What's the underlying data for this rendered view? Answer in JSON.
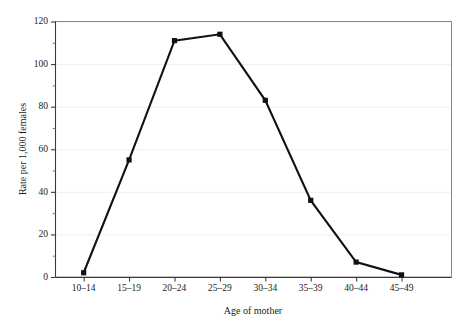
{
  "chart_data": {
    "type": "line",
    "title": "",
    "subtitle": "",
    "xlabel": "Age of mother",
    "ylabel": "Rate per 1,000 females",
    "categories": [
      "10–14",
      "15–19",
      "20–24",
      "25–29",
      "30–34",
      "35–39",
      "40–44",
      "45–49"
    ],
    "values": [
      2,
      55,
      111,
      114,
      83,
      36,
      7,
      1
    ],
    "ylim": [
      0,
      120
    ],
    "ytick_labels": [
      "0",
      "20",
      "40",
      "60",
      "80",
      "100",
      "120"
    ],
    "ytick_values": [
      0,
      20,
      40,
      60,
      80,
      100,
      120
    ],
    "yminor_values": [
      10,
      30,
      50,
      70,
      90,
      110
    ],
    "grid": "horizontal-faint",
    "legend": "none",
    "series": [
      {
        "name": "Birth rate",
        "values": [
          2,
          55,
          111,
          114,
          83,
          36,
          7,
          1
        ],
        "color": "#111111",
        "marker": "square"
      }
    ],
    "annotations": []
  },
  "colors": {
    "series": "#111111",
    "frame": "#888888",
    "axis": "#3a3a3a",
    "grid": "#f0f0f0",
    "background": "#ffffff",
    "text": "#1a1a1a"
  }
}
